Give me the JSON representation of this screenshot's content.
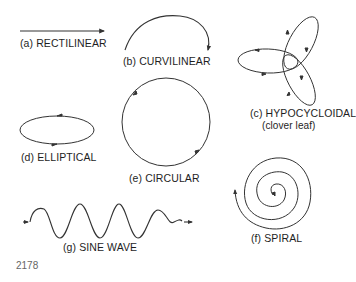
{
  "diagram": {
    "stroke_color": "#333333",
    "background": "#ffffff",
    "panels": [
      {
        "id": "a",
        "label": "(a) RECTILINEAR",
        "shape": "straight-line-arrow"
      },
      {
        "id": "b",
        "label": "(b) CURVILINEAR",
        "shape": "arc-arrow"
      },
      {
        "id": "c",
        "label": "(c) HYPOCYCLOIDAL",
        "sublabel": "(clover leaf)",
        "shape": "three-lobed-clover"
      },
      {
        "id": "d",
        "label": "(d) ELLIPTICAL",
        "shape": "ellipse-with-arrows"
      },
      {
        "id": "e",
        "label": "(e) CIRCULAR",
        "shape": "circle-with-arrows"
      },
      {
        "id": "f",
        "label": "(f) SPIRAL",
        "shape": "spiral-with-arrows"
      },
      {
        "id": "g",
        "label": "(g) SINE WAVE",
        "shape": "sine-wave-with-arrows"
      }
    ],
    "figure_number": "2178"
  }
}
